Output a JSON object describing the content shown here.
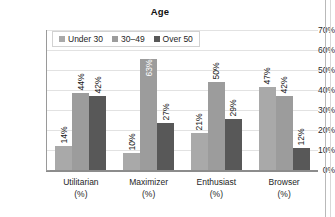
{
  "chart_data": {
    "type": "bar",
    "title": "Age",
    "xlabel": "",
    "ylabel": "",
    "ylim": [
      0,
      70
    ],
    "ytick_labels": [
      "70%",
      "60%",
      "50%",
      "40%",
      "30%",
      "20%",
      "10%",
      "0%"
    ],
    "ytick_values": [
      70,
      60,
      50,
      40,
      30,
      20,
      10,
      0
    ],
    "grid": true,
    "legend_position": "top-left",
    "categories": [
      "Utilitarian",
      "Maximizer",
      "Enthusiast",
      "Browser"
    ],
    "category_units": [
      "(%)",
      "(%)",
      "(%)",
      "(%)"
    ],
    "series": [
      {
        "name": "Under 30",
        "color": "#a9a9a9",
        "values": [
          14,
          10,
          21,
          47
        ],
        "labels": [
          "14%",
          "10%",
          "21%",
          "47%"
        ],
        "plotted": [
          12,
          8.5,
          18.5,
          41.5
        ]
      },
      {
        "name": "30–49",
        "color": "#9c9c9c",
        "values": [
          44,
          63,
          50,
          42
        ],
        "labels": [
          "44%",
          "63%",
          "50%",
          "42%"
        ],
        "plotted": [
          38.5,
          55.5,
          44,
          37
        ]
      },
      {
        "name": "Over 50",
        "color": "#585858",
        "values": [
          42,
          27,
          29,
          12
        ],
        "labels": [
          "42%",
          "27%",
          "29%",
          "12%"
        ],
        "plotted": [
          37,
          23.5,
          25.5,
          11
        ]
      }
    ]
  },
  "colors": {
    "series_1": "#a9a9a9",
    "series_2": "#9c9c9c",
    "series_3": "#585858",
    "gridline": "#e2e2e2",
    "axis": "#8c8c8c",
    "text": "#1a1a1a",
    "background": "#ffffff"
  }
}
